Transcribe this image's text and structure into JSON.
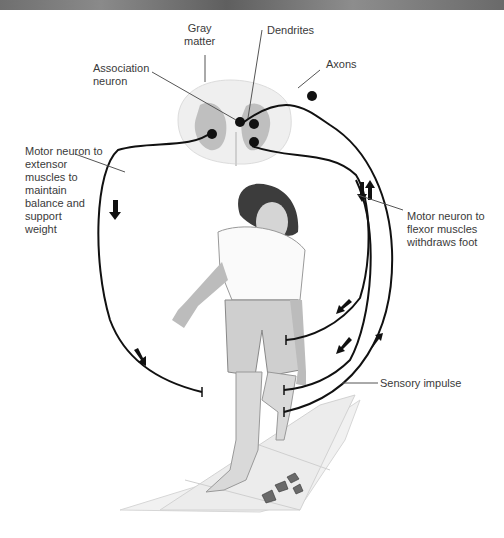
{
  "figure": {
    "labels": {
      "gray_matter": "Gray\nmatter",
      "dendrites": "Dendrites",
      "association_neuron": "Association\nneuron",
      "axons": "Axons",
      "motor_extensor": "Motor neuron to\nextensor\nmuscles to\nmaintain\nbalance and\nsupport\nweight",
      "motor_flexor": "Motor neuron to\nflexor muscles\nwithdraws foot",
      "sensory": "Sensory impulse"
    },
    "colors": {
      "nerve": "#111111",
      "white_matter": "#eeeeee",
      "gray_matter": "#bdbdbd",
      "leader_line": "#555555",
      "text": "#3a3a3a"
    }
  }
}
